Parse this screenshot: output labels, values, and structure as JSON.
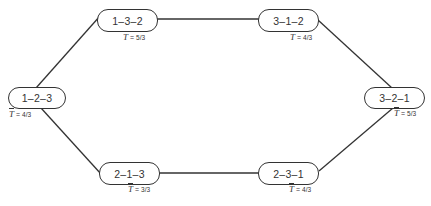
{
  "diagram": {
    "type": "permutation-graph",
    "nodes": [
      {
        "id": "n123",
        "label": "1–2–3",
        "t_symbol": "T",
        "t_eq": "=",
        "t_value": "4/3"
      },
      {
        "id": "n132",
        "label": "1–3–2",
        "t_symbol": "T",
        "t_eq": "=",
        "t_value": "5/3"
      },
      {
        "id": "n312",
        "label": "3–1–2",
        "t_symbol": "T",
        "t_eq": "=",
        "t_value": "4/3"
      },
      {
        "id": "n321",
        "label": "3–2–1",
        "t_symbol": "T",
        "t_eq": "=",
        "t_value": "5/3"
      },
      {
        "id": "n213",
        "label": "2–1–3",
        "t_symbol": "T",
        "t_eq": "=",
        "t_value": "3/3"
      },
      {
        "id": "n231",
        "label": "2–3–1",
        "t_symbol": "T",
        "t_eq": "=",
        "t_value": "4/3"
      }
    ],
    "edges": [
      {
        "from": "1–2–3",
        "to": "1–3–2"
      },
      {
        "from": "1–3–2",
        "to": "3–1–2"
      },
      {
        "from": "3–1–2",
        "to": "3–2–1"
      },
      {
        "from": "1–2–3",
        "to": "2–1–3"
      },
      {
        "from": "2–1–3",
        "to": "2–3–1"
      },
      {
        "from": "2–3–1",
        "to": "3–2–1"
      }
    ],
    "colors": {
      "line": "#333333",
      "node_border": "#333333",
      "background": "#ffffff"
    }
  }
}
